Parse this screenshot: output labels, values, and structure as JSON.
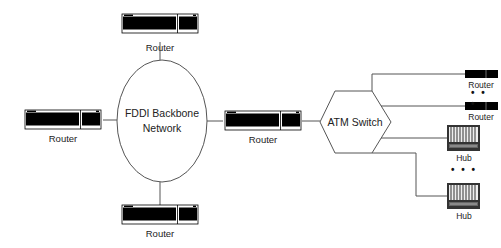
{
  "diagram": {
    "type": "network-topology",
    "backbone": {
      "label_line1": "FDDI Backbone",
      "label_line2": "Network",
      "shape": "ellipse"
    },
    "switch": {
      "label": "ATM Switch",
      "shape": "hexagon"
    },
    "nodes": {
      "router_top": {
        "label": "Router"
      },
      "router_left": {
        "label": "Router"
      },
      "router_bottom": {
        "label": "Router"
      },
      "router_middle": {
        "label": "Router"
      },
      "router_atm_1": {
        "label": "Router"
      },
      "router_atm_2": {
        "label": "Router"
      },
      "hub_1": {
        "label": "Hub"
      },
      "hub_2": {
        "label": "Hub"
      }
    },
    "ellipsis_routers": "• • •",
    "ellipsis_hubs": "• • •",
    "edges": [
      [
        "router_top",
        "backbone"
      ],
      [
        "router_left",
        "backbone"
      ],
      [
        "router_bottom",
        "backbone"
      ],
      [
        "backbone",
        "router_middle"
      ],
      [
        "router_middle",
        "switch"
      ],
      [
        "switch",
        "router_atm_1"
      ],
      [
        "switch",
        "router_atm_2"
      ],
      [
        "switch",
        "hub_1"
      ],
      [
        "switch",
        "hub_2"
      ]
    ],
    "colors": {
      "line": "#555555",
      "device": "#000000",
      "text": "#222222"
    }
  }
}
